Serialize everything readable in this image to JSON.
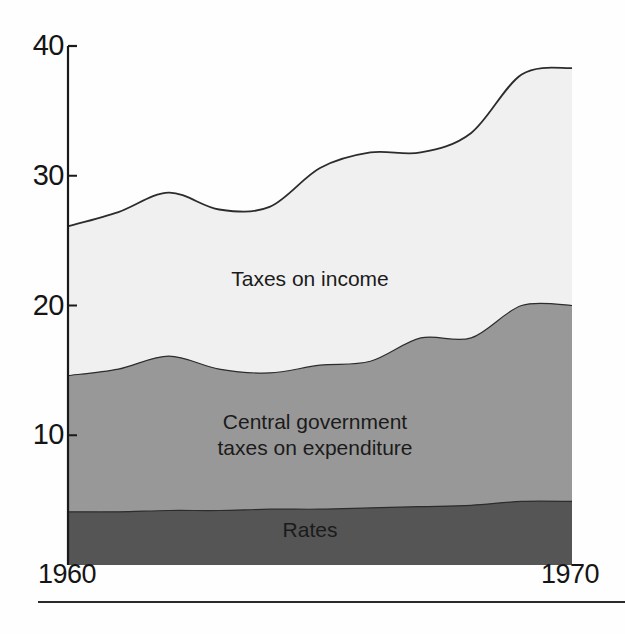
{
  "figure": {
    "background_color": "#fefefe",
    "axis_color": "#1a1a1a",
    "bottom_rule": true
  },
  "axes": {
    "y_ticks": [
      {
        "label": "40",
        "value": 40
      },
      {
        "label": "30",
        "value": 30
      },
      {
        "label": "20",
        "value": 20
      },
      {
        "label": "10",
        "value": 10
      }
    ],
    "x_labels": {
      "start": "1960",
      "end": "1970"
    }
  },
  "series_labels": {
    "income": "Taxes on income",
    "central": "Central government\ntaxes on expenditure",
    "rates": "Rates"
  },
  "colors": {
    "income_band": "#f0f0f0",
    "central_band": "#989898",
    "rates_band": "#555555",
    "outline": "#2c2c2c",
    "text": "#151515"
  },
  "chart_data": {
    "type": "area",
    "stacked": true,
    "title": "",
    "subtitle": "",
    "xlabel": "",
    "ylabel": "",
    "xlim": [
      1960,
      1970
    ],
    "ylim": [
      0,
      40
    ],
    "grid": false,
    "legend_position": "in-plot",
    "x": [
      1960,
      1961,
      1962,
      1963,
      1964,
      1965,
      1966,
      1967,
      1968,
      1969,
      1970
    ],
    "x_tick_labels": [
      "1960",
      "",
      "",
      "",
      "",
      "",
      "",
      "",
      "",
      "",
      "1970"
    ],
    "y_tick_labels": [
      "10",
      "20",
      "30",
      "40"
    ],
    "series": [
      {
        "name": "Rates",
        "fill": "#555555",
        "values": [
          4.1,
          4.1,
          4.2,
          4.2,
          4.3,
          4.3,
          4.4,
          4.5,
          4.6,
          4.9,
          4.9
        ]
      },
      {
        "name": "Central government taxes on expenditure",
        "fill": "#989898",
        "values": [
          10.5,
          11.0,
          11.9,
          10.9,
          10.5,
          11.1,
          11.3,
          13.0,
          12.9,
          15.1,
          15.1
        ]
      },
      {
        "name": "Taxes on income",
        "fill": "#f0f0f0",
        "values": [
          11.5,
          12.1,
          12.6,
          12.3,
          12.8,
          15.2,
          16.1,
          14.3,
          15.8,
          17.8,
          18.3
        ]
      }
    ],
    "cumulative_tops": {
      "rates": [
        4.1,
        4.1,
        4.2,
        4.2,
        4.3,
        4.3,
        4.4,
        4.5,
        4.6,
        4.9,
        4.9
      ],
      "rates_plus_central": [
        14.6,
        15.1,
        16.1,
        15.1,
        14.8,
        15.4,
        15.7,
        17.5,
        17.5,
        20.0,
        20.0
      ],
      "total": [
        26.1,
        27.2,
        28.7,
        27.4,
        27.6,
        30.6,
        31.8,
        31.8,
        33.3,
        37.8,
        38.3
      ]
    },
    "annotations": [
      {
        "text": "Taxes on income",
        "band": "income"
      },
      {
        "text": "Central government taxes on expenditure",
        "band": "central"
      },
      {
        "text": "Rates",
        "band": "rates"
      }
    ]
  }
}
